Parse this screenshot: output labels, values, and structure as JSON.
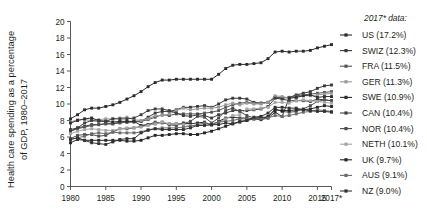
{
  "chart_data": {
    "type": "line",
    "title": "",
    "ylabel": "Health care spending as a percentage of GDP, 1980–2017",
    "xlabel": "",
    "ylim": [
      0,
      20
    ],
    "yticks": [
      0,
      2,
      4,
      6,
      8,
      10,
      12,
      14,
      16,
      18,
      20
    ],
    "xticks": [
      "1980",
      "1985",
      "1990",
      "1995",
      "2000",
      "2005",
      "2010",
      "2015",
      "2017*"
    ],
    "xtick_values": [
      1980,
      1985,
      1990,
      1995,
      2000,
      2005,
      2010,
      2015,
      2017
    ],
    "xlim": [
      1980,
      2017
    ],
    "grid": false,
    "legend_position": "right",
    "legend_title": "2017* data:",
    "x": [
      1980,
      1981,
      1982,
      1983,
      1984,
      1985,
      1986,
      1987,
      1988,
      1989,
      1990,
      1991,
      1992,
      1993,
      1994,
      1995,
      1996,
      1997,
      1998,
      1999,
      2000,
      2001,
      2002,
      2003,
      2004,
      2005,
      2006,
      2007,
      2008,
      2009,
      2010,
      2011,
      2012,
      2013,
      2014,
      2015,
      2016,
      2017
    ],
    "series": [
      {
        "name": "US",
        "label": "US (17.2%)",
        "final_value": 17.2,
        "color": "#2b2b2b",
        "values": [
          8.2,
          8.7,
          9.3,
          9.5,
          9.5,
          9.7,
          9.9,
          10.2,
          10.6,
          11.0,
          11.5,
          12.1,
          12.6,
          12.9,
          12.9,
          13.0,
          13.0,
          13.0,
          13.0,
          13.0,
          13.0,
          13.6,
          14.3,
          14.7,
          14.8,
          14.8,
          14.9,
          15.0,
          15.5,
          16.3,
          16.4,
          16.3,
          16.4,
          16.4,
          16.5,
          16.8,
          17.0,
          17.2
        ]
      },
      {
        "name": "SWIZ",
        "label": "SWIZ (12.3%)",
        "final_value": 12.3,
        "color": "#3a3a3a",
        "values": [
          6.9,
          7.1,
          7.3,
          7.5,
          7.5,
          7.6,
          7.6,
          7.8,
          7.8,
          7.9,
          7.9,
          8.4,
          8.9,
          9.1,
          9.1,
          9.3,
          9.6,
          9.6,
          9.7,
          9.8,
          9.6,
          10.0,
          10.5,
          10.7,
          10.7,
          10.6,
          10.2,
          10.1,
          10.2,
          10.8,
          10.7,
          10.8,
          11.1,
          11.3,
          11.5,
          11.9,
          12.2,
          12.3
        ]
      },
      {
        "name": "FRA",
        "label": "FRA (11.5%)",
        "final_value": 11.5,
        "color": "#565656",
        "values": [
          6.7,
          7.0,
          7.2,
          7.4,
          7.5,
          7.6,
          7.6,
          7.7,
          7.8,
          7.8,
          7.9,
          8.1,
          8.4,
          8.7,
          8.6,
          8.8,
          8.8,
          8.8,
          8.8,
          8.9,
          9.0,
          9.2,
          9.6,
          9.9,
          10.1,
          10.2,
          10.1,
          10.1,
          10.2,
          10.8,
          10.8,
          10.8,
          11.0,
          11.1,
          11.2,
          11.3,
          11.4,
          11.5
        ]
      },
      {
        "name": "GER",
        "label": "GER (11.3%)",
        "final_value": 11.3,
        "color": "#9a9a9a",
        "values": [
          7.8,
          8.1,
          8.1,
          8.0,
          8.1,
          8.2,
          8.2,
          8.3,
          8.4,
          8.1,
          8.0,
          8.2,
          8.6,
          8.6,
          8.8,
          9.2,
          9.5,
          9.3,
          9.4,
          9.5,
          9.5,
          9.6,
          9.9,
          10.1,
          9.9,
          10.1,
          10.0,
          10.0,
          10.2,
          11.0,
          10.9,
          10.7,
          10.8,
          11.0,
          11.0,
          11.1,
          11.2,
          11.3
        ]
      },
      {
        "name": "SWE",
        "label": "SWE (10.9%)",
        "final_value": 10.9,
        "color": "#2f2f2f",
        "values": [
          7.7,
          8.0,
          8.2,
          8.3,
          8.0,
          7.9,
          7.8,
          7.9,
          7.9,
          7.9,
          7.4,
          7.5,
          7.6,
          7.8,
          7.5,
          7.4,
          7.7,
          7.6,
          7.7,
          7.8,
          7.4,
          7.9,
          8.3,
          8.4,
          8.3,
          8.3,
          8.2,
          8.1,
          8.3,
          9.0,
          8.5,
          10.7,
          10.8,
          11.0,
          11.1,
          10.8,
          10.9,
          10.9
        ]
      },
      {
        "name": "CAN",
        "label": "CAN (10.4%)",
        "final_value": 10.4,
        "color": "#3f3f3f",
        "values": [
          6.7,
          7.1,
          7.7,
          8.0,
          7.9,
          7.9,
          8.2,
          8.2,
          8.2,
          8.3,
          8.7,
          9.2,
          9.4,
          9.4,
          9.2,
          8.9,
          8.6,
          8.5,
          8.7,
          8.6,
          8.3,
          8.7,
          8.9,
          9.2,
          9.2,
          9.2,
          9.3,
          9.4,
          9.7,
          10.7,
          10.6,
          10.4,
          10.4,
          10.4,
          10.3,
          10.6,
          10.5,
          10.4
        ]
      },
      {
        "name": "NOR",
        "label": "NOR (10.4%)",
        "final_value": 10.4,
        "color": "#4d4d4d",
        "values": [
          5.8,
          6.2,
          6.3,
          6.3,
          6.1,
          6.2,
          6.6,
          7.0,
          7.0,
          7.1,
          7.3,
          7.5,
          7.8,
          7.7,
          7.6,
          7.6,
          7.6,
          7.9,
          8.5,
          8.4,
          7.7,
          8.3,
          9.2,
          9.5,
          9.1,
          8.6,
          8.3,
          8.4,
          8.4,
          9.4,
          9.1,
          9.0,
          9.1,
          9.4,
          9.8,
          10.3,
          10.5,
          10.4
        ]
      },
      {
        "name": "NETH",
        "label": "NETH (10.1%)",
        "final_value": 10.1,
        "color": "#a5a5a5",
        "values": [
          6.4,
          6.7,
          6.9,
          7.0,
          6.9,
          6.8,
          6.8,
          7.0,
          7.1,
          7.1,
          7.2,
          7.4,
          7.6,
          7.8,
          7.6,
          7.6,
          7.5,
          7.4,
          7.4,
          7.5,
          7.4,
          7.7,
          8.2,
          8.6,
          8.7,
          9.4,
          9.4,
          9.5,
          9.6,
          10.2,
          10.2,
          10.1,
          10.4,
          10.5,
          10.4,
          10.3,
          10.2,
          10.1
        ]
      },
      {
        "name": "UK",
        "label": "UK (9.7%)",
        "final_value": 9.7,
        "color": "#262626",
        "values": [
          5.3,
          5.7,
          5.6,
          5.6,
          5.6,
          5.6,
          5.6,
          5.6,
          5.5,
          5.5,
          5.6,
          5.9,
          6.2,
          6.2,
          6.3,
          6.4,
          6.4,
          6.3,
          6.3,
          6.5,
          6.7,
          7.0,
          7.3,
          7.6,
          7.9,
          8.0,
          8.2,
          8.2,
          8.5,
          9.3,
          9.2,
          9.2,
          9.3,
          9.3,
          9.4,
          9.6,
          9.8,
          9.7
        ]
      },
      {
        "name": "AUS",
        "label": "AUS (9.1%)",
        "final_value": 9.1,
        "color": "#6b6b6b",
        "values": [
          5.7,
          5.9,
          6.1,
          6.4,
          6.5,
          6.4,
          6.6,
          6.5,
          6.5,
          6.5,
          6.6,
          6.9,
          7.0,
          7.1,
          7.1,
          7.1,
          7.2,
          7.3,
          7.5,
          7.7,
          7.6,
          7.8,
          7.9,
          8.0,
          8.2,
          8.2,
          8.2,
          8.2,
          8.3,
          8.6,
          8.5,
          8.6,
          8.8,
          9.0,
          9.1,
          9.3,
          9.2,
          9.1
        ]
      },
      {
        "name": "NZ",
        "label": "NZ (9.0%)",
        "final_value": 9.0,
        "color": "#333333",
        "values": [
          5.7,
          5.9,
          5.6,
          5.3,
          5.2,
          5.1,
          5.4,
          5.7,
          5.8,
          5.8,
          6.5,
          6.8,
          7.0,
          6.9,
          6.9,
          6.9,
          6.9,
          7.1,
          7.4,
          7.4,
          7.5,
          7.5,
          7.7,
          7.6,
          7.8,
          8.0,
          8.4,
          8.5,
          8.9,
          9.6,
          9.6,
          9.5,
          9.5,
          9.3,
          9.2,
          9.1,
          9.1,
          9.0
        ]
      }
    ]
  },
  "legend": {
    "title": "2017* data:",
    "entries": [
      "US (17.2%)",
      "SWIZ (12.3%)",
      "FRA (11.5%)",
      "GER (11.3%)",
      "SWE (10.9%)",
      "CAN (10.4%)",
      "NOR (10.4%)",
      "NETH (10.1%)",
      "UK (9.7%)",
      "AUS (9.1%)",
      "NZ (9.0%)"
    ]
  },
  "axes": {
    "ylabel_line1": "Health care spending as a percentage",
    "ylabel_line2": "of GDP, 1980–2017",
    "ytick_labels": [
      "0",
      "2",
      "4",
      "6",
      "8",
      "10",
      "12",
      "14",
      "16",
      "18",
      "20"
    ],
    "xtick_labels": [
      "1980",
      "1985",
      "1990",
      "1995",
      "2000",
      "2005",
      "2010",
      "2015",
      "2017*"
    ]
  }
}
